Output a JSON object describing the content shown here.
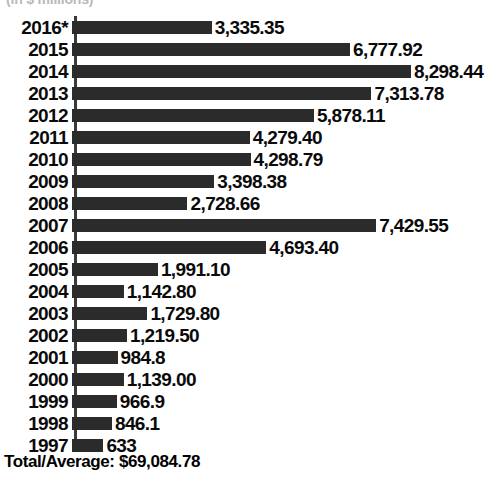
{
  "chart_data": {
    "type": "bar",
    "orientation": "horizontal",
    "title": "",
    "subtitle": "(in $ millions)",
    "xlabel": "",
    "ylabel": "",
    "grid": false,
    "legend": null,
    "xlim": [
      0,
      8298.44
    ],
    "categories": [
      "2016*",
      "2015",
      "2014",
      "2013",
      "2012",
      "2011",
      "2010",
      "2009",
      "2008",
      "2007",
      "2006",
      "2005",
      "2004",
      "2003",
      "2002",
      "2001",
      "2000",
      "1999",
      "1998",
      "1997"
    ],
    "values": [
      3335.35,
      6777.92,
      8298.44,
      7313.78,
      5878.11,
      4279.4,
      4298.79,
      3398.38,
      2728.66,
      7429.55,
      4693.4,
      1991.1,
      1142.8,
      1729.8,
      1219.5,
      984.8,
      1139.0,
      966.9,
      846.1,
      633
    ],
    "value_labels": [
      "3,335.35",
      "6,777.92",
      "8,298.44",
      "7,313.78",
      "5,878.11",
      "4,279.40",
      "4,298.79",
      "3,398.38",
      "2,728.66",
      "7,429.55",
      "4,693.40",
      "1,991.10",
      "1,142.80",
      "1,729.80",
      "1,219.50",
      "984.8",
      "1,139.00",
      "966.9",
      "846.1",
      "633"
    ],
    "bar_color": "#2b2b2b",
    "footnote_marker": "*",
    "total_label": "Total/Average: $69,084.78"
  },
  "footer": {
    "total_text": "Total/Average: $69,084.78"
  }
}
